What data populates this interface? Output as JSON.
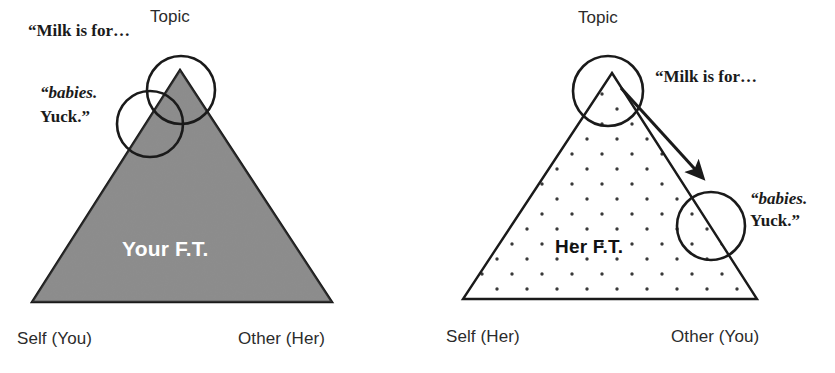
{
  "figure": {
    "background_color": "#ffffff",
    "ink_color": "#1a1a1a",
    "fill_gray": "#808080",
    "panels": [
      {
        "id": "left",
        "triangle": {
          "label": "Your F.T.",
          "label_color": "#ffffff",
          "fill": "solid-gray",
          "fill_color": "#808080",
          "apex_label": "Topic",
          "left_corner_label": "Self (You)",
          "right_corner_label": "Other (Her)"
        },
        "circles": [
          {
            "name": "topic-circle",
            "label": "Topic"
          },
          {
            "name": "babies-circle",
            "label": ""
          }
        ],
        "quotes": [
          {
            "name": "milk-quote",
            "text": "“Milk is for…"
          },
          {
            "name": "babies-quote-italic",
            "text": "“babies."
          },
          {
            "name": "yuck-quote",
            "text": "Yuck.”"
          }
        ]
      },
      {
        "id": "right",
        "triangle": {
          "label": "Her F.T.",
          "label_color": "#111111",
          "fill": "dotted",
          "fill_color": "#ffffff",
          "apex_label": "Topic",
          "left_corner_label": "Self (Her)",
          "right_corner_label": "Other (You)"
        },
        "circles": [
          {
            "name": "topic-circle",
            "label": "Topic"
          },
          {
            "name": "babies-circle",
            "label": ""
          }
        ],
        "arrow": {
          "name": "escalation-arrow",
          "from": "topic-circle",
          "to": "babies-circle"
        },
        "quotes": [
          {
            "name": "milk-quote",
            "text": "“Milk is for…"
          },
          {
            "name": "babies-quote-italic",
            "text": "“babies."
          },
          {
            "name": "yuck-quote",
            "text": "Yuck.”"
          }
        ]
      }
    ]
  },
  "left": {
    "topic": "Topic",
    "milk": "“Milk is for…",
    "babies": "“babies.",
    "yuck": "Yuck.”",
    "ft": "Your F.T.",
    "self": "Self (You)",
    "other": "Other (Her)"
  },
  "right": {
    "topic": "Topic",
    "milk": "“Milk is for…",
    "babies": "“babies.",
    "yuck": "Yuck.”",
    "ft": "Her F.T.",
    "self": "Self (Her)",
    "other": "Other (You)"
  }
}
